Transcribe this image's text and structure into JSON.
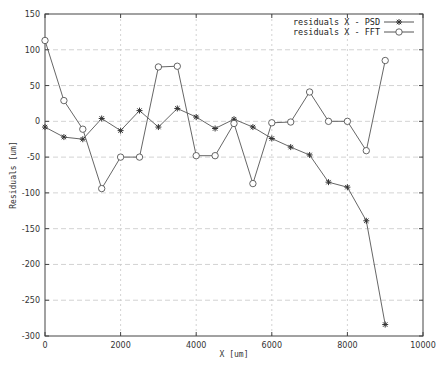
{
  "chart_data": {
    "type": "line",
    "title": "",
    "xlabel": "X [um]",
    "ylabel": "Residuals [um]",
    "xlim": [
      0,
      10000
    ],
    "ylim": [
      -300,
      150
    ],
    "xticks": [
      0,
      2000,
      4000,
      6000,
      8000,
      10000
    ],
    "yticks": [
      150,
      100,
      50,
      0,
      -50,
      -100,
      -150,
      -200,
      -250,
      -300
    ],
    "grid": true,
    "legend_position": "top-right",
    "x": [
      0,
      500,
      1000,
      1500,
      2000,
      2500,
      3000,
      3500,
      4000,
      4500,
      5000,
      5500,
      6000,
      6500,
      7000,
      7500,
      8000,
      8500,
      9000
    ],
    "series": [
      {
        "name": "residuals X - PSD",
        "marker": "asterisk",
        "values": [
          -8,
          -22,
          -25,
          4,
          -13,
          15,
          -8,
          18,
          6,
          -10,
          3,
          -8,
          -24,
          -36,
          -47,
          -85,
          -92,
          -139,
          -284
        ]
      },
      {
        "name": "residuals X - FFT",
        "marker": "circle",
        "values": [
          113,
          29,
          -11,
          -94,
          -50,
          -50,
          76,
          77,
          -48,
          -48,
          -3,
          -87,
          -2,
          -1,
          41,
          0,
          0,
          -41,
          85
        ]
      }
    ]
  },
  "labels": {
    "xlabel": "X [um]",
    "ylabel": "Residuals [um]",
    "legend_psd": "residuals X - PSD",
    "legend_fft": "residuals X - FFT"
  },
  "colors": {
    "line": "#555555",
    "axis": "#444444",
    "grid": "#c8c8c8"
  }
}
